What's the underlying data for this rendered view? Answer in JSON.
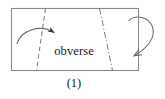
{
  "figure": {
    "caption": "(1)",
    "panel_label": "obverse",
    "colors": {
      "rectangle_stroke": "#8a8a8a",
      "fold_line_stroke": "#777777",
      "arrow_stroke": "#6e6e6e",
      "arrowhead_fill": "#3a3a3a",
      "text": "#1b1b1b",
      "background": "#ffffff"
    },
    "shapes": {
      "sheet": {
        "name": "paper-sheet",
        "type": "rectangle",
        "x": 11,
        "y": 8,
        "width": 128,
        "height": 63
      },
      "left_fold_line": {
        "name": "left-fold-line",
        "type": "dashed-line",
        "x1": 45.5,
        "y1": 8,
        "x2": 36.5,
        "y2": 71,
        "style": "dashed"
      },
      "right_fold_line": {
        "name": "right-fold-line",
        "type": "dash-dot-line",
        "x1": 99.5,
        "y1": 8,
        "x2": 112.5,
        "y2": 71,
        "style": "dash-dot"
      },
      "left_fold_arrow": {
        "name": "left-fold-arrow",
        "type": "curved-arrow",
        "direction": "left-to-right-over-fold",
        "start_x": 17,
        "start_y": 43,
        "end_x": 62,
        "end_y": 39
      },
      "right_fold_arrow": {
        "name": "right-fold-arrow",
        "type": "loop-arrow",
        "direction": "wrap-around-right-edge",
        "start_x": 130,
        "start_y": 20,
        "end_x": 131,
        "end_y": 57
      }
    }
  }
}
